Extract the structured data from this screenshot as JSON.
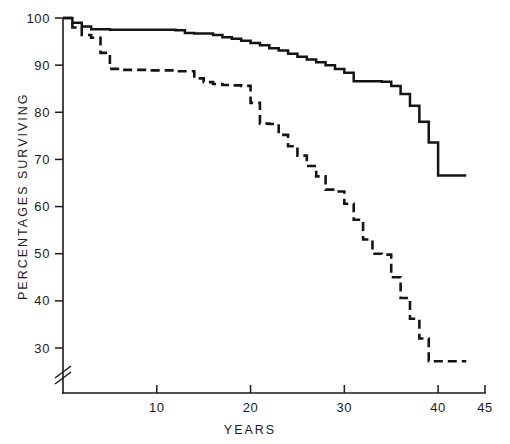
{
  "chart_data": {
    "type": "line",
    "title": "",
    "xlabel": "YEARS",
    "ylabel": "PERCENTAGES SURVIVING",
    "xlim": [
      0,
      45
    ],
    "ylim": [
      27,
      100
    ],
    "grid": false,
    "legend": "none",
    "axis_break_y": true,
    "y_ticks": [
      30,
      40,
      50,
      60,
      70,
      80,
      90,
      100
    ],
    "y_tick_labels": [
      "30",
      "40",
      "50",
      "60",
      "70",
      "80",
      "90",
      "100"
    ],
    "x_ticks": [
      10,
      20,
      30,
      40,
      45
    ],
    "x_tick_labels": [
      "10",
      "20",
      "30",
      "40",
      "45"
    ],
    "series": [
      {
        "name": "solid-curve",
        "style": "solid",
        "x": [
          0,
          1,
          2,
          3,
          5,
          8,
          11,
          12,
          13,
          14,
          16,
          17,
          18,
          19,
          20,
          21,
          22,
          23,
          24,
          25,
          26,
          27,
          28,
          29,
          30,
          31,
          34,
          35,
          36,
          37,
          38,
          39,
          40,
          43
        ],
        "y": [
          100,
          99,
          98.2,
          97.6,
          97.5,
          97.5,
          97.5,
          97.4,
          96.8,
          96.7,
          96.4,
          95.9,
          95.6,
          95.2,
          94.7,
          94.2,
          93.6,
          93.1,
          92.4,
          91.8,
          91.2,
          90.6,
          90.0,
          89.2,
          88.4,
          86.6,
          86.5,
          85.6,
          83.9,
          81.4,
          78.0,
          73.6,
          66.6,
          66.6
        ]
      },
      {
        "name": "dashed-curve",
        "style": "dashed",
        "x": [
          0,
          1,
          2,
          3,
          4,
          5,
          6,
          9,
          12,
          14,
          15,
          16,
          17,
          18,
          19,
          20,
          21,
          22,
          23,
          24,
          25,
          26,
          27,
          28,
          29,
          30,
          31,
          32,
          33,
          34,
          35,
          36,
          37,
          38,
          39,
          43
        ],
        "y": [
          100,
          98.0,
          96.4,
          95.8,
          92.6,
          89.2,
          89.0,
          88.9,
          88.7,
          87.2,
          86.4,
          86.0,
          85.8,
          85.7,
          85.6,
          82.0,
          77.6,
          77.5,
          75.2,
          72.8,
          70.8,
          68.6,
          66.4,
          63.6,
          63.2,
          60.6,
          57.2,
          53.0,
          50.0,
          49.8,
          45.0,
          40.6,
          36.2,
          32.0,
          27.2,
          27.2
        ]
      }
    ]
  }
}
